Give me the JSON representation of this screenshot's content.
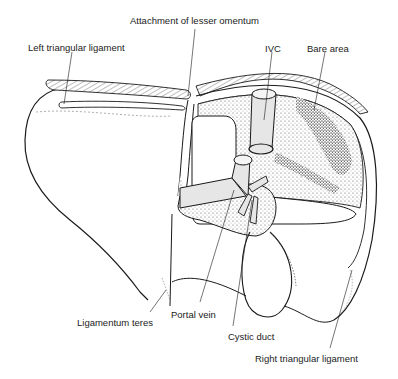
{
  "diagram": {
    "colors": {
      "outline": "#1a1a1a",
      "stipple": "#555555",
      "vessel_fill": "#e6e6e6",
      "background": "#ffffff"
    },
    "labels": [
      {
        "id": "left_triangular_ligament",
        "text": "Left triangular ligament",
        "x": 28,
        "y": 43
      },
      {
        "id": "attachment_lesser_omentum",
        "text": "Attachment of lesser omentum",
        "x": 130,
        "y": 21
      },
      {
        "id": "ivc",
        "text": "IVC",
        "x": 266,
        "y": 44
      },
      {
        "id": "bare_area",
        "text": "Bare area",
        "x": 307,
        "y": 44
      },
      {
        "id": "ligamentum_teres",
        "text": "Ligamentum teres",
        "x": 77,
        "y": 318
      },
      {
        "id": "portal_vein",
        "text": "Portal vein",
        "x": 171,
        "y": 310
      },
      {
        "id": "cystic_duct",
        "text": "Cystic duct",
        "x": 228,
        "y": 332
      },
      {
        "id": "right_triangular_ligament",
        "text": "Right triangular ligament",
        "x": 255,
        "y": 354
      }
    ],
    "structures": [
      "Left lobe",
      "Right lobe",
      "Caudate lobe",
      "Inferior vena cava",
      "Bare area",
      "Portal vein",
      "Cystic duct",
      "Gallbladder",
      "Ligamentum teres",
      "Left triangular ligament",
      "Right triangular ligament",
      "Lesser omentum attachment"
    ]
  }
}
